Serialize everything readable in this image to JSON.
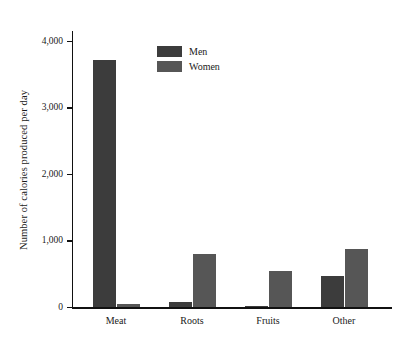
{
  "chart_data": {
    "type": "bar",
    "title": "",
    "subtitle": "",
    "xlabel": "",
    "ylabel": "Number of calories produced per day",
    "categories": [
      "Meat",
      "Roots",
      "Fruits",
      "Other"
    ],
    "series": [
      {
        "name": "Men",
        "color": "#3c3c3c",
        "values": [
          3720,
          80,
          15,
          465
        ]
      },
      {
        "name": "Women",
        "color": "#565656",
        "values": [
          40,
          790,
          540,
          870
        ]
      }
    ],
    "ylim": [
      0,
      4150
    ],
    "yticks": [
      0,
      1000,
      2000,
      3000,
      4000
    ],
    "ytick_labels": [
      "0",
      "1,000",
      "2,000",
      "3,000",
      "4,000"
    ],
    "grid": false,
    "legend_position": "top-center",
    "legend": [
      {
        "label": "Men",
        "color": "#3c3c3c"
      },
      {
        "label": "Women",
        "color": "#565656"
      }
    ],
    "annotations": [],
    "background_color": "#ffffff",
    "axis_color": "#111111"
  }
}
